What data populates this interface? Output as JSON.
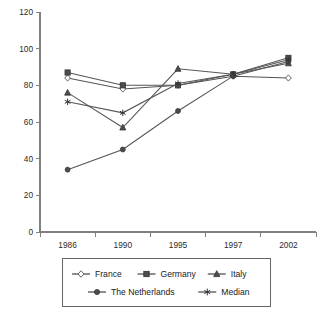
{
  "chart_data": {
    "type": "line",
    "title": "",
    "subtitle": "",
    "xlabel": "",
    "ylabel": "",
    "categories": [
      "1986",
      "1990",
      "1995",
      "1997",
      "2002"
    ],
    "ylim": [
      0,
      120
    ],
    "yticks": [
      0,
      20,
      40,
      60,
      80,
      100,
      120
    ],
    "grid": false,
    "legend_position": "bottom",
    "series": [
      {
        "name": "France",
        "marker": "open-diamond",
        "values": [
          84,
          78,
          80,
          85,
          84
        ]
      },
      {
        "name": "Germany",
        "marker": "filled-square",
        "values": [
          87,
          80,
          80,
          86,
          95
        ]
      },
      {
        "name": "Italy",
        "marker": "filled-triangle",
        "values": [
          76,
          57,
          89,
          86,
          92
        ]
      },
      {
        "name": "The Netherlands",
        "marker": "filled-circle",
        "values": [
          34,
          45,
          66,
          85,
          93
        ]
      },
      {
        "name": "Median",
        "marker": "star",
        "values": [
          71,
          65,
          81,
          86,
          94
        ]
      }
    ]
  },
  "legend": {
    "entries": [
      {
        "label": "France",
        "marker": "open-diamond"
      },
      {
        "label": "Germany",
        "marker": "filled-square"
      },
      {
        "label": "Italy",
        "marker": "filled-triangle"
      },
      {
        "label": "The Netherlands",
        "marker": "filled-circle"
      },
      {
        "label": "Median",
        "marker": "star"
      }
    ]
  }
}
